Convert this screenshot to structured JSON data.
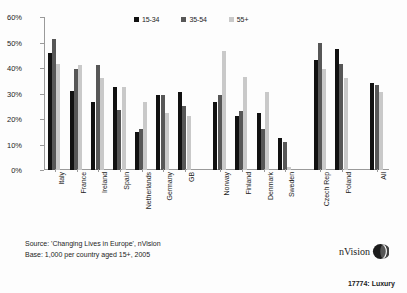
{
  "chart_data": {
    "type": "bar",
    "title": "",
    "subtitle": "",
    "xlabel": "",
    "ylabel": "",
    "ylim": [
      0,
      60
    ],
    "ytick_labels": [
      "0%",
      "10%",
      "20%",
      "30%",
      "40%",
      "50%",
      "60%"
    ],
    "ytick_values": [
      0,
      10,
      20,
      30,
      40,
      50,
      60
    ],
    "grid": false,
    "legend_position": "top-center",
    "categories": [
      "Italy",
      "France",
      "Ireland",
      "Spain",
      "Netherlands",
      "Germany",
      "GB",
      "Norway",
      "Finland",
      "Denmark",
      "Sweden",
      "Czech Rep",
      "Poland",
      "All"
    ],
    "group_gaps_after": [
      "GB",
      "Sweden",
      "Poland"
    ],
    "series": [
      {
        "name": "15-34",
        "color": "#111111",
        "values": [
          46.0,
          31.0,
          26.5,
          32.5,
          15.0,
          29.5,
          30.5,
          26.5,
          21.0,
          22.5,
          12.5,
          43.0,
          47.5,
          34.0
        ]
      },
      {
        "name": "35-54",
        "color": "#575757",
        "values": [
          51.5,
          39.5,
          41.0,
          23.5,
          16.0,
          29.5,
          25.0,
          29.5,
          23.0,
          16.0,
          11.0,
          50.0,
          41.5,
          33.5
        ]
      },
      {
        "name": "55+",
        "color": "#c9c9c9",
        "values": [
          41.5,
          41.0,
          36.0,
          32.5,
          26.5,
          22.5,
          21.0,
          46.5,
          36.5,
          30.5,
          1.0,
          39.5,
          36.0,
          30.5
        ]
      }
    ]
  },
  "legend": {
    "entries": [
      {
        "label": "15-34",
        "color": "#111111"
      },
      {
        "label": "35-54",
        "color": "#575757"
      },
      {
        "label": "55+",
        "color": "#c9c9c9"
      }
    ]
  },
  "footer": {
    "source_line": "Source: 'Changing Lives in Europe', nVision",
    "base_line": "Base: 1,000 per country aged 15+, 2005"
  },
  "brand": {
    "name": "nVision",
    "mark": "globe-icon"
  },
  "reference": {
    "code": "17774: Luxury"
  }
}
